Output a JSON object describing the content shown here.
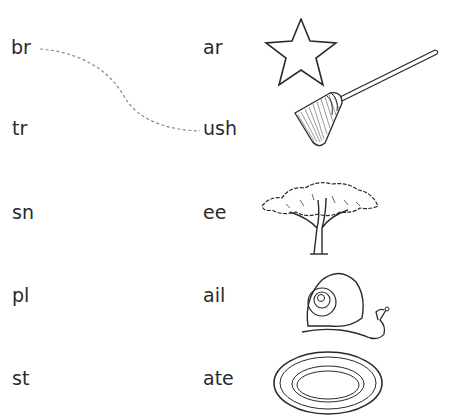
{
  "worksheet": {
    "onsets": [
      {
        "text": "br"
      },
      {
        "text": "tr"
      },
      {
        "text": "sn"
      },
      {
        "text": "pl"
      },
      {
        "text": "st"
      }
    ],
    "endings": [
      {
        "text": "ar",
        "picture": "star-icon"
      },
      {
        "text": "ush",
        "picture": "brush-icon"
      },
      {
        "text": "ee",
        "picture": "tree-icon"
      },
      {
        "text": "ail",
        "picture": "snail-icon"
      },
      {
        "text": "ate",
        "picture": "plate-icon"
      }
    ],
    "example_link": {
      "from": "br",
      "to": "ush",
      "style": "dashed"
    }
  }
}
